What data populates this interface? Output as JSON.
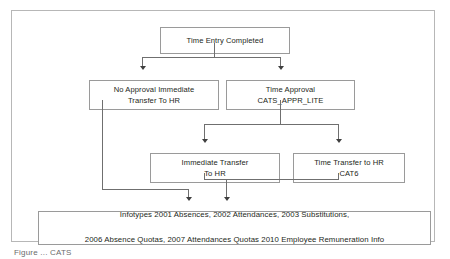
{
  "figure": {
    "nodes": {
      "top": "Time Entry Completed",
      "no_approval": "No Approval Immediate\nTransfer To HR",
      "time_approval": "Time Approval\nCATS_APPR_LITE",
      "immediate_transfer": "Immediate Transfer\nTo HR",
      "time_transfer": "Time Transfer to HR\nCAT6",
      "infotypes_line1": "Infotypes 2001 Absences, 2002 Attendances, 2003 Substitutions,",
      "infotypes_line2": "2006 Absence Quotas, 2007 Attendances Quotas 2010 Employee Remuneration Info"
    },
    "caption": "Figure ...  CATS",
    "colors": {
      "frame_border": "#b7b7b7",
      "node_border": "#9a9a9a",
      "connector": "#6f6f6f",
      "arrow_head": "#3f3f3f",
      "text": "#231f20",
      "background": "#ffffff"
    }
  }
}
